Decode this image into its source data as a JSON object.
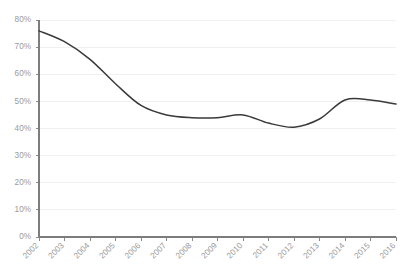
{
  "chart_data": {
    "type": "line",
    "title": "",
    "subtitle": "",
    "xlabel": "",
    "ylabel": "",
    "categories": [
      "2002",
      "2003",
      "2004",
      "2005",
      "2006",
      "2007",
      "2008",
      "2009",
      "2010",
      "2011",
      "2012",
      "2013",
      "2014",
      "2015",
      "2016"
    ],
    "values": [
      76.0,
      72.0,
      65.5,
      56.5,
      48.5,
      45.0,
      44.0,
      44.0,
      45.0,
      42.0,
      40.5,
      43.5,
      50.5,
      50.5,
      49.0
    ],
    "series": [
      {
        "name": "",
        "values": [
          76.0,
          72.0,
          65.5,
          56.5,
          48.5,
          45.0,
          44.0,
          44.0,
          45.0,
          42.0,
          40.5,
          43.5,
          50.5,
          50.5,
          49.0
        ]
      }
    ],
    "ylim": [
      0,
      80
    ],
    "xlim": [
      "2002",
      "2016"
    ],
    "ytick_values": [
      0,
      10,
      20,
      30,
      40,
      50,
      60,
      70,
      80
    ],
    "ytick_labels": [
      "0%",
      "10%",
      "20%",
      "30%",
      "40%",
      "50%",
      "60%",
      "70%",
      "80%"
    ],
    "xtick_labels": [
      "2002",
      "2003",
      "2004",
      "2005",
      "2006",
      "2007",
      "2008",
      "2009",
      "2010",
      "2011",
      "2012",
      "2013",
      "2014",
      "2015",
      "2016"
    ],
    "grid": true,
    "grid_axis": "y",
    "legend": false,
    "legend_position": "none",
    "smoothing": true,
    "markers": false,
    "annotations": [],
    "colors": {
      "line": "#3a3a3a",
      "grid": "#f0f0f0",
      "axis": "#7d7d7d",
      "tick_label": "#9a9a9a",
      "background": "#ffffff"
    }
  },
  "layout": {
    "plot_left": 39,
    "plot_right": 396,
    "plot_top": 20,
    "plot_bottom": 237,
    "xlabel_rotation": -45
  }
}
